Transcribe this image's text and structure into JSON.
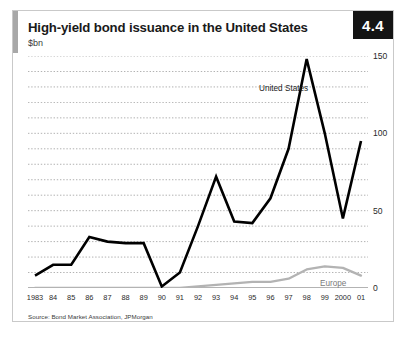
{
  "figure": {
    "badge": "4.4",
    "title": "High-yield bond issuance in the United States",
    "subtitle": "$bn",
    "source": "Source: Bond Market Association, JPMorgan",
    "accent_color": "#a8a8a8",
    "badge_bg": "#141414",
    "badge_fg": "#ffffff"
  },
  "chart_data": {
    "type": "line",
    "title": "High-yield bond issuance in the United States",
    "subtitle": "$bn",
    "xlabel": "",
    "ylabel": "$bn",
    "ylim": [
      0,
      150
    ],
    "yticks": [
      0,
      50,
      100,
      150
    ],
    "ytick_labels": [
      "0",
      "50",
      "100",
      "150"
    ],
    "grid": true,
    "grid_interval": 10,
    "grid_style": "dotted-horizontal",
    "legend_position": "inline-annotation",
    "x": [
      1983,
      1984,
      1985,
      1986,
      1987,
      1988,
      1989,
      1990,
      1991,
      1992,
      1993,
      1994,
      1995,
      1996,
      1997,
      1998,
      1999,
      2000,
      2001
    ],
    "categories": [
      "1983",
      "84",
      "85",
      "86",
      "87",
      "88",
      "89",
      "90",
      "91",
      "92",
      "93",
      "94",
      "95",
      "96",
      "97",
      "98",
      "99",
      "2000",
      "01"
    ],
    "series": [
      {
        "name": "United States",
        "color": "#000000",
        "values": [
          8,
          15,
          15,
          33,
          30,
          29,
          29,
          1,
          10,
          40,
          72,
          43,
          42,
          58,
          90,
          148,
          100,
          45,
          95
        ]
      },
      {
        "name": "Europe",
        "color": "#b3b3b3",
        "values": [
          0,
          0,
          0,
          0,
          0,
          0,
          0,
          0,
          0,
          1,
          2,
          3,
          4,
          4,
          6,
          12,
          14,
          13,
          8
        ]
      }
    ],
    "annotations": [
      {
        "text": "United States",
        "series": "United States"
      },
      {
        "text": "Europe",
        "series": "Europe"
      }
    ]
  }
}
